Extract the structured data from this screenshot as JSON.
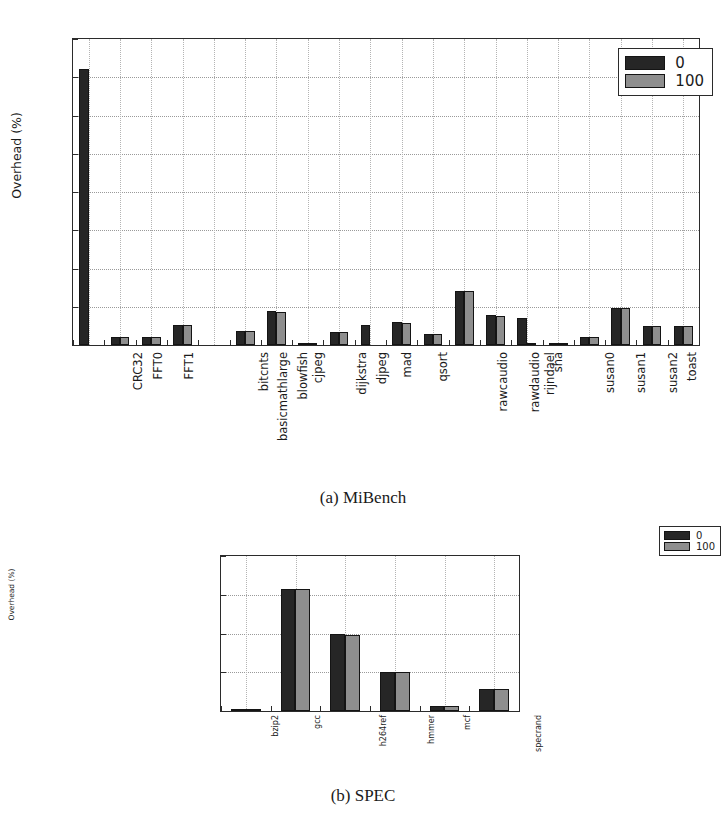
{
  "figures": [
    {
      "id": "figA",
      "caption": "(a) MiBench",
      "chart": {
        "type": "bar",
        "title": "",
        "xlabel": "",
        "ylabel": "Overhead (%)",
        "ylim": [
          0.0,
          4.0
        ],
        "yticks": [
          "0.0",
          "0.5",
          "1.0",
          "1.5",
          "2.0",
          "2.5",
          "3.0",
          "3.5",
          "4.0"
        ],
        "ytick_values": [
          0.0,
          0.5,
          1.0,
          1.5,
          2.0,
          2.5,
          3.0,
          3.5,
          4.0
        ],
        "grid": true,
        "legend_position": "upper right",
        "categories": [
          "CRC32",
          "FFT0",
          "FFT1",
          "basicmathlarge",
          "bitcnts",
          "blowfish",
          "cjpeg",
          "dijkstra",
          "djpeg",
          "mad",
          "qsort",
          "rawcaudio",
          "rawdaudio",
          "rijndael",
          "sha",
          "susan0",
          "susan1",
          "susan2",
          "toast",
          "untoast"
        ],
        "series": [
          {
            "name": "0",
            "color": "#262626",
            "values": [
              3.61,
              0.11,
              0.11,
              0.26,
              0.0,
              0.18,
              0.44,
              0.02,
              0.17,
              0.26,
              0.3,
              0.14,
              0.71,
              0.39,
              0.35,
              0.02,
              0.11,
              0.49,
              0.25,
              0.25
            ]
          },
          {
            "name": "100",
            "color": "#8e8e8e",
            "values": [
              0.0,
              0.11,
              0.11,
              0.26,
              0.0,
              0.18,
              0.43,
              0.02,
              0.17,
              0.0,
              0.29,
              0.14,
              0.71,
              0.38,
              0.01,
              0.03,
              0.11,
              0.48,
              0.25,
              0.25
            ]
          }
        ]
      }
    },
    {
      "id": "figB",
      "caption": "(b) SPEC",
      "chart": {
        "type": "bar",
        "title": "",
        "xlabel": "",
        "ylabel": "Overhead (%)",
        "ylim": [
          0.0,
          2.0
        ],
        "yticks": [
          "0.0",
          "0.5",
          "1.0",
          "1.5",
          "2.0"
        ],
        "ytick_values": [
          0.0,
          0.5,
          1.0,
          1.5,
          2.0
        ],
        "grid": true,
        "legend_position": "upper right",
        "categories": [
          "bzip2",
          "gcc",
          "h264ref",
          "hmmer",
          "mcf",
          "specrand"
        ],
        "series": [
          {
            "name": "0",
            "color": "#262626",
            "values": [
              0.01,
              1.58,
              0.99,
              0.5,
              0.06,
              0.28
            ]
          },
          {
            "name": "100",
            "color": "#8e8e8e",
            "values": [
              0.01,
              1.57,
              0.98,
              0.5,
              0.06,
              0.28
            ]
          }
        ]
      }
    }
  ]
}
